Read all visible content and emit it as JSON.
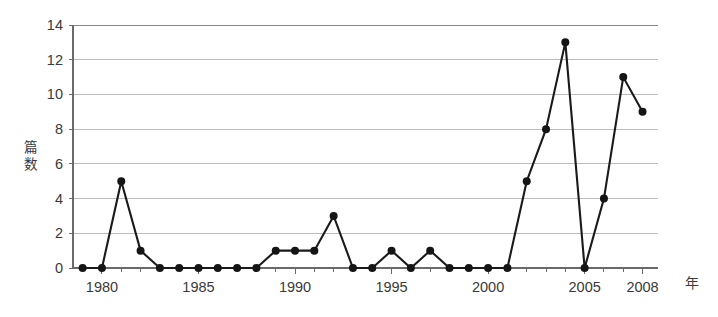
{
  "chart_data": {
    "type": "line",
    "title": "",
    "xlabel": "年",
    "ylabel": "篇数",
    "ylabel_chars": [
      "篇",
      "数"
    ],
    "x": [
      1979,
      1980,
      1981,
      1982,
      1983,
      1984,
      1985,
      1986,
      1987,
      1988,
      1989,
      1990,
      1991,
      1992,
      1993,
      1994,
      1995,
      1996,
      1997,
      1998,
      1999,
      2000,
      2001,
      2002,
      2003,
      2004,
      2005,
      2006,
      2007,
      2008
    ],
    "values": [
      0,
      0,
      5,
      1,
      0,
      0,
      0,
      0,
      0,
      0,
      1,
      1,
      1,
      3,
      0,
      0,
      1,
      0,
      1,
      0,
      0,
      0,
      0,
      5,
      8,
      13,
      0,
      4,
      11,
      9
    ],
    "series": [
      {
        "name": "篇数",
        "values": [
          0,
          0,
          5,
          1,
          0,
          0,
          0,
          0,
          0,
          0,
          1,
          1,
          1,
          3,
          0,
          0,
          1,
          0,
          1,
          0,
          0,
          0,
          0,
          5,
          8,
          13,
          0,
          4,
          11,
          9
        ]
      }
    ],
    "xlim": [
      1978.5,
      2008.8
    ],
    "ylim": [
      0,
      14
    ],
    "y_ticks": [
      0,
      2,
      4,
      6,
      8,
      10,
      12,
      14
    ],
    "y_tick_labels": [
      "0",
      "2",
      "4",
      "6",
      "8",
      "10",
      "12",
      "14"
    ],
    "x_tick_labels": [
      "1980",
      "1985",
      "1990",
      "1995",
      "2000",
      "2005",
      "2008"
    ],
    "x_tick_values": [
      1980,
      1985,
      1990,
      1995,
      2000,
      2005,
      2008
    ],
    "x_minor_ticks": [
      1979,
      1980,
      1981,
      1982,
      1983,
      1984,
      1985,
      1986,
      1987,
      1988,
      1989,
      1990,
      1991,
      1992,
      1993,
      1994,
      1995,
      1996,
      1997,
      1998,
      1999,
      2000,
      2001,
      2002,
      2003,
      2004,
      2005,
      2006,
      2007,
      2008
    ],
    "grid": true,
    "grid_axis": "y",
    "legend": false,
    "legend_position": "none",
    "line_color": "#1a1a1a",
    "marker_color": "#151515",
    "grid_color": "#bcbcbc",
    "axis_color": "#6a6a6a",
    "background_color": "#ffffff",
    "annotations": []
  }
}
